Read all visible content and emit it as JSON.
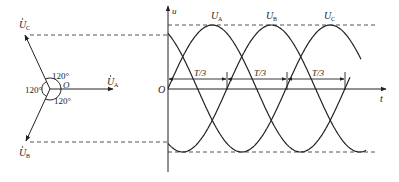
{
  "diagram": {
    "type": "three-phase voltage phasor and waveform",
    "phasor": {
      "origin_label": "O",
      "phasors": [
        {
          "name": "U_A",
          "label": "U",
          "subscript": "A",
          "dot": true,
          "angle_deg": 0
        },
        {
          "name": "U_B",
          "label": "U",
          "subscript": "B",
          "dot": true,
          "angle_deg": -120
        },
        {
          "name": "U_C",
          "label": "U",
          "subscript": "C",
          "dot": true,
          "angle_deg": 120
        }
      ],
      "angle_labels": [
        "120°",
        "120°",
        "120°"
      ]
    },
    "waveform": {
      "y_axis_label": "u",
      "x_axis_label": "t",
      "origin_label": "O",
      "curves": [
        {
          "name": "U_A",
          "label": "U",
          "subscript": "A",
          "phase_deg": 0
        },
        {
          "name": "U_B",
          "label": "U",
          "subscript": "B",
          "phase_deg": -120
        },
        {
          "name": "U_C",
          "label": "U",
          "subscript": "C",
          "phase_deg": 120
        }
      ],
      "intervals": [
        "T/3",
        "T/3",
        "T/3"
      ]
    },
    "colors": {
      "stroke": "#222222",
      "dashed": "#555555",
      "background": "#ffffff"
    }
  }
}
